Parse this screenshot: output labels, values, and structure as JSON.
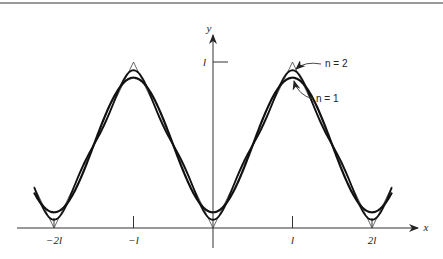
{
  "chart_data": {
    "type": "line",
    "title": "",
    "xlabel": "x",
    "ylabel": "y",
    "x_ticks": [
      "-2l",
      "-l",
      "l",
      "2l"
    ],
    "x_tick_values": [
      -2,
      -1,
      1,
      2
    ],
    "y_ticks": [
      "l"
    ],
    "y_tick_values": [
      1
    ],
    "xlim": [
      -2.5,
      2.5
    ],
    "ylim": [
      0,
      1.1
    ],
    "grid": false,
    "legend": "annotations",
    "series": [
      {
        "name": "triangle wave f(x)",
        "description": "periodic |x| on [-l, l], period 2l",
        "x": [
          -2,
          -1,
          0,
          1,
          2
        ],
        "y": [
          0,
          1,
          0,
          1,
          0
        ]
      },
      {
        "name": "n = 1",
        "description": "partial Fourier sum l/2 - (4l/π²)cos(πx/l)",
        "x": [
          -2,
          -1,
          0,
          1,
          2
        ],
        "y": [
          0.095,
          0.905,
          0.095,
          0.905,
          0.095
        ]
      },
      {
        "name": "n = 2",
        "description": "partial Fourier sum including cos(3πx/l)/9 term",
        "x": [
          -2,
          -1,
          0,
          1,
          2
        ],
        "y": [
          0.05,
          0.95,
          0.05,
          0.95,
          0.05
        ]
      }
    ],
    "annotations": [
      "n = 2",
      "n = 1"
    ]
  },
  "axes": {
    "x_label": "x",
    "y_label": "y",
    "y_tick_label": "l",
    "x_tick_labels": [
      "−2l",
      "−l",
      "l",
      "2l"
    ]
  },
  "annotations": {
    "n2": "n = 2",
    "n1": "n = 1"
  }
}
